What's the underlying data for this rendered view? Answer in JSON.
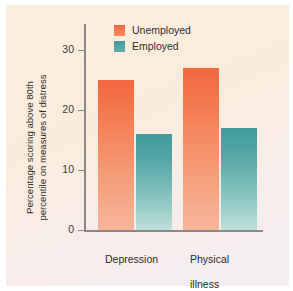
{
  "chart_data": {
    "type": "bar",
    "title": "",
    "xlabel": "",
    "ylabel": "Percentage scoring above 80th percentile on measures of distress",
    "ylabel_lines": [
      "Percentage scoring above 80th",
      "percentile on measures of distress"
    ],
    "categories": [
      "Depression",
      "Physical illness"
    ],
    "category_lines": [
      [
        "Depression"
      ],
      [
        "Physical",
        "illness"
      ]
    ],
    "series": [
      {
        "name": "Unemployed",
        "values": [
          25,
          27
        ],
        "color": "#f2673f"
      },
      {
        "name": "Employed",
        "values": [
          16,
          17
        ],
        "color": "#3e9a9c"
      }
    ],
    "ylim": [
      0,
      32
    ],
    "yticks": [
      0,
      10,
      20,
      30
    ],
    "ytick_labels": [
      "0",
      "10",
      "20",
      "30"
    ],
    "grid": false,
    "legend_position": "top-center"
  },
  "legend": {
    "items": [
      {
        "label": "Unemployed"
      },
      {
        "label": "Employed"
      }
    ]
  },
  "axes": {
    "y_title_line1": "Percentage scoring above 80th",
    "y_title_line2": "percentile on measures of distress",
    "ytick_0": "0",
    "ytick_10": "10",
    "ytick_20": "20",
    "ytick_30": "30"
  },
  "categories": {
    "cat1_line1": "Depression",
    "cat2_line1": "Physical",
    "cat2_line2": "illness"
  },
  "colors": {
    "background": "#faeede",
    "unemployed": "#f2673f",
    "employed": "#3e9a9c",
    "axis": "#8c8a88",
    "text": "#2f2e2d"
  }
}
